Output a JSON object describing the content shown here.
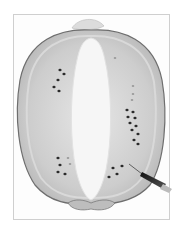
{
  "image": {
    "subject": "pencil drawing of a halved kiwi fruit",
    "colors": {
      "background": "#ffffff",
      "frame": "#cfcfcf",
      "flesh": "#c9c9c9",
      "skin_edge": "#6e6e6e",
      "core": "#f4f4f4",
      "seed": "#2a2a2a",
      "pencil": "#1e1e1e"
    }
  }
}
